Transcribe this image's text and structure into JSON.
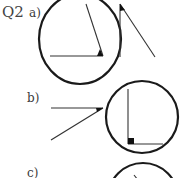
{
  "question": {
    "number": "Q2",
    "parts": [
      {
        "label": "a)",
        "description": "Protractor circle with acute angle (vertex marked) and a separate acute angle to measure",
        "circle": {
          "cx": 80,
          "cy": 38,
          "r": 42
        },
        "angle_in_circle": {
          "vertex": [
            103,
            56
          ],
          "arm1_end": [
            50,
            56
          ],
          "arm2_end": [
            86,
            4
          ]
        },
        "standalone_angle": {
          "vertex": [
            120,
            4
          ],
          "arm1_end": [
            120,
            56
          ],
          "arm2_end": [
            155,
            57
          ]
        }
      },
      {
        "label": "b)",
        "description": "Separate acute angle and protractor circle containing a right angle",
        "standalone_angle": {
          "vertex": [
            103,
            108
          ],
          "arm1_end": [
            51,
            108
          ],
          "arm2_end": [
            51,
            140
          ]
        },
        "circle": {
          "cx": 142,
          "cy": 117,
          "r": 36
        },
        "angle_in_circle": {
          "vertex": [
            128,
            144
          ],
          "arm1_end": [
            128,
            89
          ],
          "arm2_end": [
            163,
            144
          ],
          "right_angle": true
        }
      },
      {
        "label": "c)",
        "description": "Protractor circle (partially visible)",
        "circle": {
          "cx": 143,
          "cy": 198,
          "r": 35
        },
        "angle_in_circle": {
          "arm_start": [
            134,
            177
          ],
          "arm_end": [
            140,
            184
          ]
        }
      }
    ]
  },
  "colors": {
    "stroke": "#1a1a1a",
    "line": "#333333",
    "text": "#3a3a3a"
  }
}
